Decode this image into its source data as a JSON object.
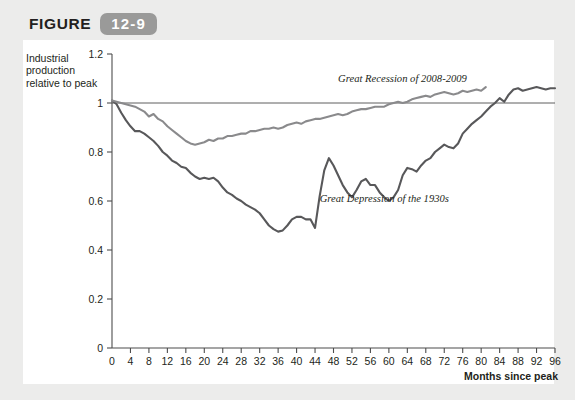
{
  "figure": {
    "word": "FIGURE",
    "number": "12-9"
  },
  "chart_data": {
    "type": "line",
    "title": "",
    "xlabel": "Months since peak",
    "ylabel": "Industrial production relative to peak",
    "xlim": [
      0,
      96
    ],
    "ylim": [
      0,
      1.2
    ],
    "xticks": [
      0,
      4,
      8,
      12,
      16,
      20,
      24,
      28,
      32,
      36,
      40,
      44,
      48,
      52,
      56,
      60,
      64,
      68,
      72,
      76,
      80,
      84,
      88,
      92,
      96
    ],
    "yticks": [
      0,
      0.2,
      0.4,
      0.6,
      0.8,
      1,
      1.2
    ],
    "ytick_labels": [
      "0",
      "0.2",
      "0.4",
      "0.6",
      "0.8",
      "1",
      "1.2"
    ],
    "grid": false,
    "reference_line_y": 1,
    "legend": "annotations-inline",
    "series": [
      {
        "name": "Great Depression of the 1930s",
        "color": "#58585a",
        "annotation_x": 45,
        "annotation_y": 0.595,
        "x": [
          0,
          1,
          2,
          3,
          4,
          5,
          6,
          7,
          8,
          9,
          10,
          11,
          12,
          13,
          14,
          15,
          16,
          17,
          18,
          19,
          20,
          21,
          22,
          23,
          24,
          25,
          26,
          27,
          28,
          29,
          30,
          31,
          32,
          33,
          34,
          35,
          36,
          37,
          38,
          39,
          40,
          41,
          42,
          43,
          44,
          45,
          46,
          47,
          48,
          49,
          50,
          51,
          52,
          53,
          54,
          55,
          56,
          57,
          58,
          59,
          60,
          61,
          62,
          63,
          64,
          65,
          66,
          67,
          68,
          69,
          70,
          71,
          72,
          73,
          74,
          75,
          76,
          77,
          78,
          79,
          80,
          81,
          82,
          83,
          84,
          85,
          86,
          87,
          88,
          89,
          90,
          91,
          92,
          93,
          94,
          95,
          96
        ],
        "y": [
          1.01,
          0.995,
          0.96,
          0.93,
          0.905,
          0.885,
          0.885,
          0.875,
          0.86,
          0.845,
          0.825,
          0.8,
          0.785,
          0.765,
          0.755,
          0.74,
          0.735,
          0.715,
          0.7,
          0.69,
          0.695,
          0.69,
          0.695,
          0.68,
          0.655,
          0.635,
          0.625,
          0.61,
          0.6,
          0.585,
          0.575,
          0.565,
          0.55,
          0.525,
          0.5,
          0.485,
          0.475,
          0.48,
          0.5,
          0.525,
          0.535,
          0.535,
          0.525,
          0.525,
          0.49,
          0.62,
          0.725,
          0.775,
          0.745,
          0.705,
          0.665,
          0.635,
          0.615,
          0.645,
          0.68,
          0.69,
          0.665,
          0.665,
          0.635,
          0.615,
          0.6,
          0.615,
          0.645,
          0.705,
          0.735,
          0.73,
          0.72,
          0.745,
          0.765,
          0.775,
          0.8,
          0.815,
          0.83,
          0.82,
          0.815,
          0.835,
          0.875,
          0.895,
          0.915,
          0.93,
          0.945,
          0.965,
          0.985,
          1.0,
          1.02,
          1.005,
          1.035,
          1.055,
          1.06,
          1.05,
          1.055,
          1.06,
          1.065,
          1.06,
          1.055,
          1.06,
          1.06
        ]
      },
      {
        "name": "Great Recession of 2008-2009",
        "color": "#8a8a8c",
        "annotation_x": 49,
        "annotation_y": 1.085,
        "x": [
          0,
          1,
          2,
          3,
          4,
          5,
          6,
          7,
          8,
          9,
          10,
          11,
          12,
          13,
          14,
          15,
          16,
          17,
          18,
          19,
          20,
          21,
          22,
          23,
          24,
          25,
          26,
          27,
          28,
          29,
          30,
          31,
          32,
          33,
          34,
          35,
          36,
          37,
          38,
          39,
          40,
          41,
          42,
          43,
          44,
          45,
          46,
          47,
          48,
          49,
          50,
          51,
          52,
          53,
          54,
          55,
          56,
          57,
          58,
          59,
          60,
          61,
          62,
          63,
          64,
          65,
          66,
          67,
          68,
          69,
          70,
          71,
          72,
          73,
          74,
          75,
          76,
          77,
          78,
          79,
          80,
          81
        ],
        "y": [
          1.01,
          1.005,
          1.0,
          0.995,
          0.99,
          0.985,
          0.975,
          0.965,
          0.945,
          0.955,
          0.935,
          0.925,
          0.905,
          0.89,
          0.875,
          0.86,
          0.845,
          0.835,
          0.83,
          0.835,
          0.84,
          0.85,
          0.845,
          0.855,
          0.855,
          0.865,
          0.865,
          0.87,
          0.875,
          0.875,
          0.885,
          0.885,
          0.89,
          0.895,
          0.895,
          0.9,
          0.895,
          0.9,
          0.91,
          0.915,
          0.92,
          0.915,
          0.925,
          0.93,
          0.935,
          0.935,
          0.94,
          0.945,
          0.95,
          0.955,
          0.95,
          0.955,
          0.965,
          0.97,
          0.975,
          0.975,
          0.98,
          0.985,
          0.985,
          0.985,
          0.995,
          1.0,
          1.005,
          1.0,
          1.005,
          1.015,
          1.02,
          1.025,
          1.03,
          1.025,
          1.035,
          1.04,
          1.045,
          1.04,
          1.035,
          1.04,
          1.05,
          1.045,
          1.05,
          1.055,
          1.05,
          1.065
        ]
      }
    ]
  }
}
